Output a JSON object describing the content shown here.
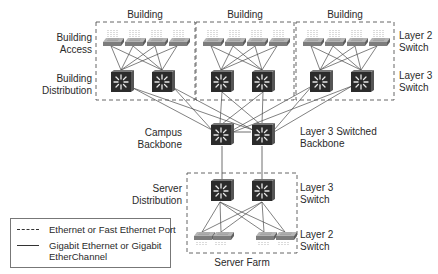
{
  "diagram": {
    "type": "campus-network-hierarchy",
    "buildings": [
      {
        "label": "Building"
      },
      {
        "label": "Building"
      },
      {
        "label": "Building"
      }
    ],
    "left_labels": {
      "building_access": [
        "Building",
        "Access"
      ],
      "building_distribution": [
        "Building",
        "Distribution"
      ],
      "campus_backbone": [
        "Campus",
        "Backbone"
      ],
      "server_distribution": [
        "Server",
        "Distribution"
      ]
    },
    "right_labels": {
      "layer2_top": [
        "Layer 2",
        "Switch"
      ],
      "layer3_top": [
        "Layer 3",
        "Switch"
      ],
      "backbone": [
        "Layer 3 Switched",
        "Backbone"
      ],
      "layer3_server": [
        "Layer 3",
        "Switch"
      ],
      "layer2_server": [
        "Layer 2",
        "Switch"
      ]
    },
    "server_farm_label": "Server Farm",
    "legend": {
      "dashed": "Ethernet or Fast Ethernet Port",
      "solid_line1": "Gigabit Ethernet or Gigabit",
      "solid_line2": "EtherChannel"
    },
    "colors": {
      "l3_switch": "#2b2b2b",
      "l2_switch": "#8a8a8a",
      "link": "#444444",
      "dashed_border": "#555555"
    }
  }
}
